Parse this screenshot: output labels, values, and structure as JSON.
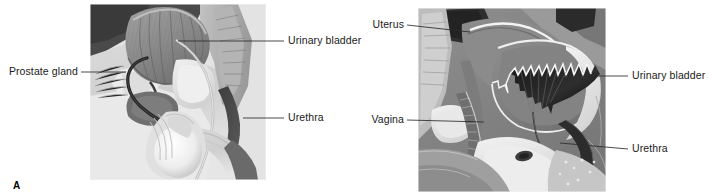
{
  "figure": {
    "caption_a": "A",
    "background_color": "#ffffff",
    "label_color": "#1a1a1a",
    "leader_color": "#2a2a2a"
  },
  "panels": [
    {
      "id": "panel-a",
      "caption": "A",
      "view": "male-pelvis-sagittal-section-with-indwelling-catheter",
      "frame": {
        "x": 90,
        "y": 4,
        "width": 176,
        "height": 176
      },
      "labels": [
        {
          "name": "prostate-gland",
          "text": "Prostate gland",
          "text_anchor": "end",
          "text_x": 78,
          "text_y": 75,
          "leader": "M 81 72 L 126 72"
        },
        {
          "name": "urinary-bladder",
          "text": "Urinary bladder",
          "text_anchor": "start",
          "text_x": 288,
          "text_y": 44,
          "leader": "M 284 41 L 178 41"
        },
        {
          "name": "urethra",
          "text": "Urethra",
          "text_anchor": "start",
          "text_x": 288,
          "text_y": 121,
          "leader": "M 284 118 L 243 118"
        }
      ]
    },
    {
      "id": "panel-b",
      "caption": "",
      "view": "female-pelvis-sagittal-section-with-indwelling-catheter",
      "frame": {
        "x": 418,
        "y": 8,
        "width": 188,
        "height": 184
      },
      "labels": [
        {
          "name": "uterus",
          "text": "Uterus",
          "text_anchor": "end",
          "text_x": 404,
          "text_y": 28,
          "leader": "M 407 25 L 470 32"
        },
        {
          "name": "vagina",
          "text": "Vagina",
          "text_anchor": "end",
          "text_x": 404,
          "text_y": 123,
          "leader": "M 407 120 L 484 122"
        },
        {
          "name": "urinary-bladder",
          "text": "Urinary bladder",
          "text_anchor": "start",
          "text_x": 632,
          "text_y": 79,
          "leader": "M 628 76 L 565 76"
        },
        {
          "name": "urethra",
          "text": "Urethra",
          "text_anchor": "start",
          "text_x": 632,
          "text_y": 152,
          "leader": "M 628 149 L 560 143"
        }
      ]
    }
  ]
}
